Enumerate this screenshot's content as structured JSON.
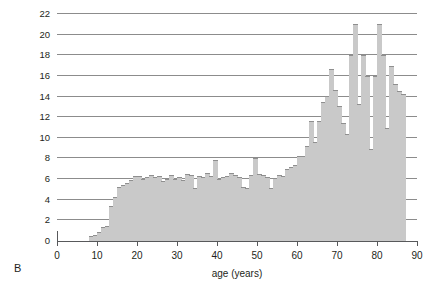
{
  "panel": {
    "label": "B"
  },
  "chart_data": {
    "type": "bar",
    "title": "",
    "subtitle": "",
    "xlabel": "age (years)",
    "ylabel": "gonadotropin (units /day)",
    "xlim": [
      0,
      90
    ],
    "ylim": [
      0,
      22
    ],
    "grid": true,
    "legend": null,
    "bar_fill_color": "#c9c9c9",
    "bar_edge_color": "#8f8f8f",
    "gridline_color": "#8c8c8c",
    "axis_color": "#58595b",
    "xticks": [
      0,
      10,
      20,
      30,
      40,
      50,
      60,
      70,
      80,
      90
    ],
    "xtick_labels": [
      "0",
      "10",
      "20",
      "30",
      "40",
      "50",
      "60",
      "70",
      "80",
      "90"
    ],
    "yticks": [
      0,
      2,
      4,
      6,
      8,
      10,
      12,
      14,
      16,
      18,
      20,
      22
    ],
    "ytick_labels": [
      "0",
      "2",
      "4",
      "6",
      "8",
      "10",
      "12",
      "14",
      "16",
      "18",
      "20",
      "22"
    ],
    "bin_width": 1,
    "x_start": 8,
    "x_end": 87,
    "categories": [
      8,
      9,
      10,
      11,
      12,
      13,
      14,
      15,
      16,
      17,
      18,
      19,
      20,
      21,
      22,
      23,
      24,
      25,
      26,
      27,
      28,
      29,
      30,
      31,
      32,
      33,
      34,
      35,
      36,
      37,
      38,
      39,
      40,
      41,
      42,
      43,
      44,
      45,
      46,
      47,
      48,
      49,
      50,
      51,
      52,
      53,
      54,
      55,
      56,
      57,
      58,
      59,
      60,
      61,
      62,
      63,
      64,
      65,
      66,
      67,
      68,
      69,
      70,
      71,
      72,
      73,
      74,
      75,
      76,
      77,
      78,
      79,
      80,
      81,
      82,
      83,
      84,
      85,
      86
    ],
    "values": [
      0.5,
      0.6,
      0.9,
      1.4,
      1.5,
      3.4,
      4.3,
      5.2,
      5.4,
      5.6,
      5.9,
      6.3,
      6.3,
      6.0,
      6.2,
      6.4,
      6.2,
      6.3,
      5.8,
      6.0,
      6.4,
      6.0,
      6.2,
      5.9,
      6.5,
      6.4,
      5.1,
      6.3,
      6.2,
      6.6,
      6.3,
      7.9,
      6.0,
      6.2,
      6.3,
      6.6,
      6.4,
      6.2,
      5.2,
      5.1,
      6.4,
      8.0,
      6.5,
      6.4,
      6.2,
      5.1,
      6.1,
      6.4,
      6.3,
      7.0,
      7.2,
      7.4,
      8.2,
      8.2,
      9.2,
      11.6,
      9.6,
      11.6,
      13.5,
      14.1,
      16.7,
      14.6,
      13.1,
      11.4,
      10.4,
      18.0,
      21.0,
      13.3,
      18.0,
      16.0,
      8.9,
      16.0,
      21.0,
      18.0,
      11.0,
      17.0,
      15.2,
      14.5,
      14.2
    ]
  }
}
